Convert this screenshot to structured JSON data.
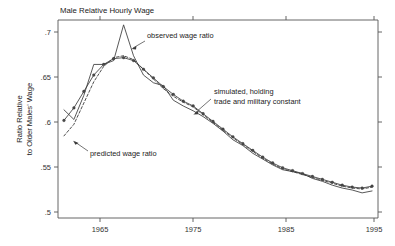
{
  "chart_data": {
    "type": "line",
    "title": "Male Relative Hourly Wage",
    "xlabel": "",
    "ylabel_line1": "Ratio Relative",
    "ylabel_line2": "to Older Males' Wage",
    "xlim": [
      1963.4,
      1995.6
    ],
    "ylim": [
      0.5,
      0.705
    ],
    "grid": false,
    "legend_position": "annotations-inline",
    "xticks": [
      1965,
      1975,
      1985,
      1995
    ],
    "xtick_labels": [
      "1965",
      "1975",
      "1985",
      "1995"
    ],
    "yticks": [
      0.5,
      0.55,
      0.6,
      0.65,
      0.7
    ],
    "ytick_labels": [
      ".5",
      ".55",
      ".6",
      ".65",
      ".7"
    ],
    "x": [
      1964,
      1965,
      1966,
      1967,
      1968,
      1969,
      1970,
      1971,
      1972,
      1973,
      1974,
      1975,
      1976,
      1977,
      1978,
      1979,
      1980,
      1981,
      1982,
      1983,
      1984,
      1985,
      1986,
      1987,
      1988,
      1989,
      1990,
      1991,
      1992,
      1993,
      1994,
      1995
    ],
    "series": [
      {
        "name": "observed wage ratio",
        "style": "solid",
        "markers": false,
        "values": [
          0.612,
          0.602,
          0.627,
          0.659,
          0.659,
          0.663,
          0.7,
          0.668,
          0.648,
          0.64,
          0.637,
          0.622,
          0.616,
          0.611,
          0.605,
          0.598,
          0.59,
          0.581,
          0.575,
          0.567,
          0.561,
          0.555,
          0.55,
          0.548,
          0.546,
          0.541,
          0.538,
          0.534,
          0.531,
          0.529,
          0.526,
          0.528
        ]
      },
      {
        "name": "predicted wage ratio",
        "style": "dashed",
        "markers": false,
        "values": [
          0.585,
          0.597,
          0.619,
          0.641,
          0.657,
          0.666,
          0.668,
          0.664,
          0.654,
          0.644,
          0.634,
          0.626,
          0.62,
          0.615,
          0.607,
          0.599,
          0.591,
          0.583,
          0.576,
          0.569,
          0.562,
          0.556,
          0.551,
          0.548,
          0.545,
          0.542,
          0.539,
          0.536,
          0.533,
          0.531,
          0.53,
          0.532
        ]
      },
      {
        "name": "simulated, holding trade and military constant",
        "style": "solid-markers",
        "markers": true,
        "values": [
          0.601,
          0.614,
          0.631,
          0.648,
          0.659,
          0.665,
          0.666,
          0.663,
          0.654,
          0.645,
          0.636,
          0.628,
          0.621,
          0.616,
          0.608,
          0.6,
          0.592,
          0.584,
          0.577,
          0.57,
          0.563,
          0.557,
          0.552,
          0.549,
          0.546,
          0.543,
          0.54,
          0.537,
          0.534,
          0.532,
          0.531,
          0.533
        ]
      }
    ],
    "annotations": [
      {
        "key": "observed",
        "text": "observed wage ratio",
        "text_x": 147,
        "text_y": 36,
        "arrow_from_x": 145,
        "arrow_from_y": 40,
        "arrow_to_x": 132,
        "arrow_to_y": 48
      },
      {
        "key": "simulated_line1",
        "text": "simulated, holding",
        "text_x": 214,
        "text_y": 92,
        "arrow_from_x": 212,
        "arrow_from_y": 101,
        "arrow_to_x": 194,
        "arrow_to_y": 113
      },
      {
        "key": "simulated_line2",
        "text": "trade and military constant",
        "text_x": 214,
        "text_y": 102,
        "arrow_from_x": null,
        "arrow_from_y": null,
        "arrow_to_x": null,
        "arrow_to_y": null
      },
      {
        "key": "predicted",
        "text": "predicted wage ratio",
        "text_x": 90,
        "text_y": 153,
        "arrow_from_x": 88,
        "arrow_from_y": 150,
        "arrow_to_x": 74,
        "arrow_to_y": 141
      }
    ],
    "colors": {
      "line": "#3a3a3a",
      "axis": "#555555",
      "text": "#222222",
      "background": "#ffffff"
    }
  }
}
